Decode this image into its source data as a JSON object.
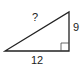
{
  "diagram": {
    "type": "right-triangle",
    "labels": {
      "hypotenuse": "?",
      "vertical_leg": "9",
      "base": "12"
    },
    "right_angle_marker": "bottom-right",
    "stroke_color": "#222222"
  }
}
